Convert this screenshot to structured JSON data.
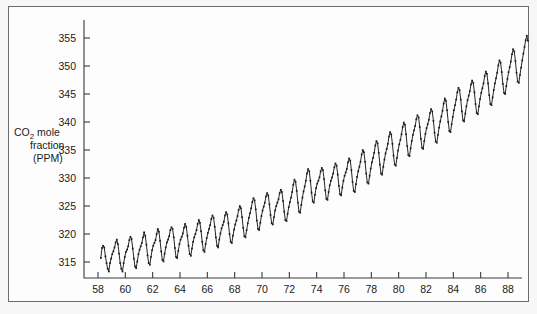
{
  "figure": {
    "background_color": "#f7f7f7",
    "plot_background_color": "#fdfdfd",
    "frame_color": "#6b6b6b",
    "line_color": "#262626"
  },
  "axis": {
    "y_title_line1_pre": "CO",
    "y_title_line1_sub": "2",
    "y_title_line1_post": " mole",
    "y_title_line2": "fraction",
    "y_title_line3": "(PPM)",
    "y_ticks": [
      315,
      320,
      325,
      330,
      335,
      340,
      345,
      350,
      355
    ],
    "x_ticks": [
      58,
      60,
      62,
      64,
      66,
      68,
      70,
      72,
      74,
      76,
      78,
      80,
      82,
      84,
      86,
      88
    ]
  },
  "chart_data": {
    "type": "line",
    "title": "",
    "subtitle": "",
    "xlabel": "",
    "ylabel": "CO2 mole fraction (PPM)",
    "xlim": [
      57.8,
      89.6
    ],
    "ylim": [
      311.5,
      357.5
    ],
    "grid": false,
    "legend": "none",
    "x_tick_labels": [
      "58",
      "60",
      "62",
      "64",
      "66",
      "68",
      "70",
      "72",
      "74",
      "76",
      "78",
      "80",
      "82",
      "84",
      "86",
      "88"
    ],
    "y_tick_labels": [
      "315",
      "320",
      "325",
      "330",
      "335",
      "340",
      "345",
      "350",
      "355"
    ],
    "x_unit": "year (19xx)",
    "y_unit": "PPM",
    "marker": "square",
    "series": [
      {
        "name": "Mauna Loa monthly mean CO2",
        "x": [
          58.208,
          58.292,
          58.375,
          58.458,
          58.542,
          58.625,
          58.708,
          58.792,
          58.875,
          58.958,
          59.042,
          59.125,
          59.208,
          59.292,
          59.375,
          59.458,
          59.542,
          59.625,
          59.708,
          59.792,
          59.875,
          59.958,
          60.042,
          60.125,
          60.208,
          60.292,
          60.375,
          60.458,
          60.542,
          60.625,
          60.708,
          60.792,
          60.875,
          60.958,
          61.042,
          61.125,
          61.208,
          61.292,
          61.375,
          61.458,
          61.542,
          61.625,
          61.708,
          61.792,
          61.875,
          61.958,
          62.042,
          62.125,
          62.208,
          62.292,
          62.375,
          62.458,
          62.542,
          62.625,
          62.708,
          62.792,
          62.875,
          62.958,
          63.042,
          63.125,
          63.208,
          63.292,
          63.375,
          63.458,
          63.542,
          63.625,
          63.708,
          63.792,
          63.875,
          63.958,
          64.042,
          64.125,
          64.208,
          64.292,
          64.375,
          64.458,
          64.542,
          64.625,
          64.708,
          64.792,
          64.875,
          64.958,
          65.042,
          65.125,
          65.208,
          65.292,
          65.375,
          65.458,
          65.542,
          65.625,
          65.708,
          65.792,
          65.875,
          65.958,
          66.042,
          66.125,
          66.208,
          66.292,
          66.375,
          66.458,
          66.542,
          66.625,
          66.708,
          66.792,
          66.875,
          66.958,
          67.042,
          67.125,
          67.208,
          67.292,
          67.375,
          67.458,
          67.542,
          67.625,
          67.708,
          67.792,
          67.875,
          67.958,
          68.042,
          68.125,
          68.208,
          68.292,
          68.375,
          68.458,
          68.542,
          68.625,
          68.708,
          68.792,
          68.875,
          68.958,
          69.042,
          69.125,
          69.208,
          69.292,
          69.375,
          69.458,
          69.542,
          69.625,
          69.708,
          69.792,
          69.875,
          69.958,
          70.042,
          70.125,
          70.208,
          70.292,
          70.375,
          70.458,
          70.542,
          70.625,
          70.708,
          70.792,
          70.875,
          70.958,
          71.042,
          71.125,
          71.208,
          71.292,
          71.375,
          71.458,
          71.542,
          71.625,
          71.708,
          71.792,
          71.875,
          71.958,
          72.042,
          72.125,
          72.208,
          72.292,
          72.375,
          72.458,
          72.542,
          72.625,
          72.708,
          72.792,
          72.875,
          72.958,
          73.042,
          73.125,
          73.208,
          73.292,
          73.375,
          73.458,
          73.542,
          73.625,
          73.708,
          73.792,
          73.875,
          73.958,
          74.042,
          74.125,
          74.208,
          74.292,
          74.375,
          74.458,
          74.542,
          74.625,
          74.708,
          74.792,
          74.875,
          74.958,
          75.042,
          75.125,
          75.208,
          75.292,
          75.375,
          75.458,
          75.542,
          75.625,
          75.708,
          75.792,
          75.875,
          75.958,
          76.042,
          76.125,
          76.208,
          76.292,
          76.375,
          76.458,
          76.542,
          76.625,
          76.708,
          76.792,
          76.875,
          76.958,
          77.042,
          77.125,
          77.208,
          77.292,
          77.375,
          77.458,
          77.542,
          77.625,
          77.708,
          77.792,
          77.875,
          77.958,
          78.042,
          78.125,
          78.208,
          78.292,
          78.375,
          78.458,
          78.542,
          78.625,
          78.708,
          78.792,
          78.875,
          78.958,
          79.042,
          79.125,
          79.208,
          79.292,
          79.375,
          79.458,
          79.542,
          79.625,
          79.708,
          79.792,
          79.875,
          79.958,
          80.042,
          80.125,
          80.208,
          80.292,
          80.375,
          80.458,
          80.542,
          80.625,
          80.708,
          80.792,
          80.875,
          80.958,
          81.042,
          81.125,
          81.208,
          81.292,
          81.375,
          81.458,
          81.542,
          81.625,
          81.708,
          81.792,
          81.875,
          81.958,
          82.042,
          82.125,
          82.208,
          82.292,
          82.375,
          82.458,
          82.542,
          82.625,
          82.708,
          82.792,
          82.875,
          82.958,
          83.042,
          83.125,
          83.208,
          83.292,
          83.375,
          83.458,
          83.542,
          83.625,
          83.708,
          83.792,
          83.875,
          83.958,
          84.042,
          84.125,
          84.208,
          84.292,
          84.375,
          84.458,
          84.542,
          84.625,
          84.708,
          84.792,
          84.875,
          84.958,
          85.042,
          85.125,
          85.208,
          85.292,
          85.375,
          85.458,
          85.542,
          85.625,
          85.708,
          85.792,
          85.875,
          85.958,
          86.042,
          86.125,
          86.208,
          86.292,
          86.375,
          86.458,
          86.542,
          86.625,
          86.708,
          86.792,
          86.875,
          86.958,
          87.042,
          87.125,
          87.208,
          87.292,
          87.375,
          87.458,
          87.542,
          87.625,
          87.708,
          87.792,
          87.875,
          87.958,
          88.042,
          88.125,
          88.208,
          88.292,
          88.375,
          88.458,
          88.542,
          88.625,
          88.708,
          88.792,
          88.875,
          88.958,
          89.042,
          89.125,
          89.208,
          89.292,
          89.375,
          89.458
        ],
        "y": [
          315.7,
          317.5,
          317.9,
          317.6,
          316.0,
          314.8,
          313.8,
          313.3,
          314.8,
          315.6,
          316.4,
          316.9,
          317.6,
          318.5,
          319.0,
          318.2,
          316.5,
          314.8,
          313.8,
          313.3,
          314.8,
          315.9,
          316.8,
          317.2,
          317.8,
          318.9,
          319.5,
          319.1,
          317.4,
          315.6,
          314.2,
          313.9,
          315.1,
          316.4,
          317.2,
          317.8,
          318.4,
          319.4,
          320.3,
          319.7,
          318.1,
          316.2,
          314.8,
          314.5,
          315.9,
          317.1,
          317.9,
          318.4,
          318.9,
          320.0,
          320.9,
          320.4,
          318.8,
          316.9,
          315.4,
          315.1,
          316.5,
          317.6,
          318.5,
          319.0,
          319.6,
          320.7,
          321.2,
          320.9,
          319.4,
          317.5,
          315.9,
          315.7,
          317.0,
          318.2,
          319.0,
          319.5,
          320.1,
          321.1,
          321.8,
          321.3,
          319.7,
          317.9,
          316.4,
          316.1,
          317.4,
          318.6,
          319.4,
          320.0,
          320.7,
          321.8,
          322.5,
          322.0,
          320.5,
          318.6,
          317.1,
          316.8,
          318.2,
          319.3,
          320.2,
          320.9,
          321.6,
          322.7,
          323.3,
          322.9,
          321.3,
          319.4,
          317.9,
          317.6,
          319.0,
          320.1,
          321.0,
          321.6,
          322.2,
          323.3,
          323.9,
          323.5,
          321.9,
          320.0,
          318.6,
          318.4,
          319.7,
          320.8,
          321.7,
          322.4,
          323.2,
          324.3,
          325.0,
          324.6,
          323.0,
          321.1,
          319.6,
          319.4,
          320.7,
          321.9,
          322.9,
          323.7,
          324.6,
          325.7,
          326.4,
          326.0,
          324.4,
          322.4,
          320.9,
          320.7,
          322.0,
          323.2,
          324.2,
          324.9,
          325.6,
          326.7,
          327.3,
          326.9,
          325.3,
          323.4,
          321.9,
          321.7,
          323.0,
          324.2,
          325.0,
          325.6,
          326.2,
          327.3,
          327.9,
          327.5,
          325.9,
          324.0,
          322.5,
          322.3,
          323.6,
          324.8,
          325.7,
          326.5,
          327.5,
          328.8,
          329.7,
          329.3,
          327.7,
          325.6,
          324.0,
          323.8,
          325.2,
          326.5,
          327.6,
          328.5,
          329.5,
          330.8,
          331.6,
          331.2,
          329.5,
          327.4,
          325.8,
          325.6,
          327.0,
          328.2,
          329.0,
          329.5,
          330.1,
          331.2,
          331.8,
          331.4,
          329.8,
          327.8,
          326.3,
          326.1,
          327.5,
          328.7,
          329.5,
          330.1,
          330.8,
          331.9,
          332.6,
          332.2,
          330.6,
          328.6,
          327.1,
          326.9,
          328.3,
          329.5,
          330.4,
          331.0,
          331.6,
          332.8,
          333.5,
          333.1,
          331.4,
          329.3,
          327.7,
          327.5,
          328.9,
          330.2,
          331.2,
          332.0,
          332.9,
          334.2,
          335.0,
          334.6,
          332.9,
          330.8,
          329.2,
          329.0,
          330.4,
          331.7,
          332.8,
          333.6,
          334.5,
          335.8,
          336.6,
          336.2,
          334.5,
          332.4,
          330.8,
          330.6,
          332.0,
          333.3,
          334.4,
          335.2,
          336.1,
          337.4,
          338.2,
          337.8,
          336.1,
          334.0,
          332.4,
          332.2,
          333.6,
          334.9,
          336.0,
          336.8,
          337.8,
          339.1,
          339.9,
          339.5,
          337.8,
          335.7,
          334.1,
          333.9,
          335.3,
          336.6,
          337.7,
          338.5,
          339.3,
          340.5,
          341.2,
          340.8,
          339.1,
          337.0,
          335.4,
          335.2,
          336.6,
          337.9,
          338.9,
          339.6,
          340.4,
          341.6,
          342.3,
          341.9,
          340.2,
          338.1,
          336.5,
          336.3,
          337.7,
          339.0,
          340.1,
          341.0,
          342.0,
          343.3,
          344.2,
          343.8,
          342.1,
          340.0,
          338.4,
          338.2,
          339.6,
          340.9,
          342.1,
          343.0,
          344.0,
          345.3,
          346.1,
          345.7,
          344.0,
          341.9,
          340.3,
          340.1,
          341.5,
          342.8,
          343.9,
          344.7,
          345.5,
          346.7,
          347.4,
          347.0,
          345.3,
          343.2,
          341.6,
          341.4,
          342.8,
          344.1,
          345.2,
          346.0,
          346.9,
          348.2,
          349.0,
          348.6,
          346.9,
          344.8,
          343.2,
          343.0,
          344.4,
          345.7,
          346.9,
          347.8,
          348.8,
          350.1,
          351.0,
          350.6,
          348.9,
          346.8,
          345.2,
          345.0,
          346.4,
          347.7,
          348.9,
          349.8,
          350.8,
          352.1,
          353.0,
          352.6,
          350.9,
          348.8,
          347.2,
          347.0,
          348.4,
          349.7,
          351.0,
          352.2,
          353.4,
          354.6,
          355.4,
          354.5
        ]
      }
    ]
  }
}
